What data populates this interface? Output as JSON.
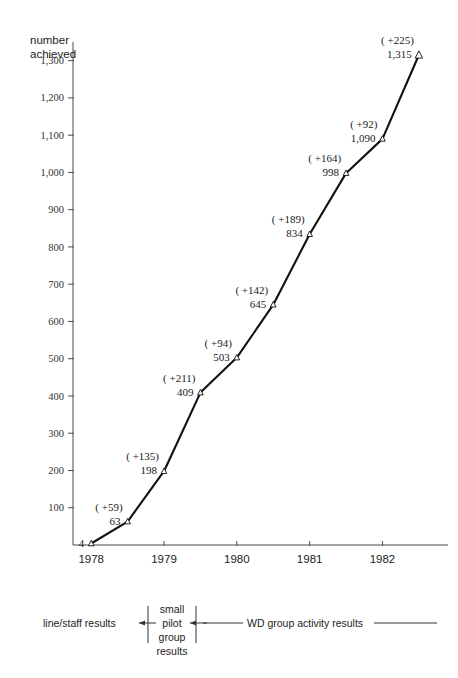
{
  "chart_data": {
    "type": "line",
    "title": "",
    "xlabel": "",
    "ylabel": "number achieved",
    "ylabel_line1": "number",
    "ylabel_line2": "achieved",
    "x": [
      1978.0,
      1978.5,
      1979.0,
      1979.5,
      1980.0,
      1980.5,
      1981.0,
      1981.5,
      1982.0,
      1982.5
    ],
    "values": [
      4,
      63,
      198,
      409,
      503,
      645,
      834,
      998,
      1090,
      1315
    ],
    "point_labels": [
      "4",
      "63",
      "198",
      "409",
      "503",
      "645",
      "834",
      "998",
      "1,090",
      "1,315"
    ],
    "delta_labels": [
      "",
      "( +59)",
      "( +135)",
      "( +211)",
      "( +94)",
      "( +142)",
      "( +189)",
      "( +164)",
      "( +92)",
      "( +225)"
    ],
    "deltas": [
      null,
      59,
      135,
      211,
      94,
      142,
      189,
      164,
      92,
      225
    ],
    "ylim": [
      0,
      1350
    ],
    "yticks": [
      100,
      200,
      300,
      400,
      500,
      600,
      700,
      800,
      900,
      1000,
      1100,
      1200,
      1300
    ],
    "ytick_labels": [
      "100",
      "200",
      "300",
      "400",
      "500",
      "600",
      "700",
      "800",
      "900",
      "1,000",
      "1,100",
      "1,200",
      "1,300"
    ],
    "xlim": [
      1977.75,
      1982.9
    ],
    "xticks": [
      1978,
      1979,
      1980,
      1981,
      1982
    ],
    "xtick_labels": [
      "1978",
      "1979",
      "1980",
      "1981",
      "1982"
    ],
    "grid": false,
    "legend_position": "below-axis",
    "marker": "open-triangle",
    "line_color": "#111111",
    "axis_color": "#4a4a4a"
  },
  "legend": {
    "phase_1": "line/staff results",
    "phase_2_line1": "small",
    "phase_2_line2": "pilot",
    "phase_2_line3": "group",
    "phase_2_line4": "results",
    "phase_3": "WD group activity results"
  }
}
